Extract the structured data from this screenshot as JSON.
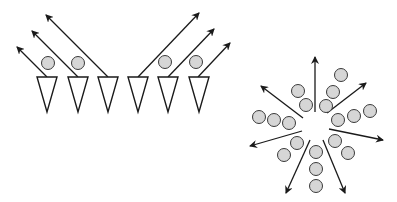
{
  "colors": {
    "background": "#ffffff",
    "stroke": "#1a1a1a",
    "particle_fill": "#d6d6d6",
    "particle_stroke": "#3a3a3a"
  },
  "left_panel": {
    "label": "aligned-collective-motion",
    "triangles": [
      {
        "x1": 37,
        "x2": 57,
        "top": 77,
        "apex_x": 47,
        "apex_y": 112
      },
      {
        "x1": 68,
        "x2": 88,
        "top": 77,
        "apex_x": 78,
        "apex_y": 112
      },
      {
        "x1": 98,
        "x2": 118,
        "top": 77,
        "apex_x": 108,
        "apex_y": 112
      },
      {
        "x1": 128,
        "x2": 148,
        "top": 77,
        "apex_x": 138,
        "apex_y": 112
      },
      {
        "x1": 158,
        "x2": 178,
        "top": 77,
        "apex_x": 168,
        "apex_y": 112
      },
      {
        "x1": 189,
        "x2": 209,
        "top": 77,
        "apex_x": 199,
        "apex_y": 112
      }
    ],
    "particles": [
      {
        "cx": 48,
        "cy": 63,
        "r": 6.5
      },
      {
        "cx": 78,
        "cy": 63,
        "r": 6.5
      },
      {
        "cx": 165,
        "cy": 62,
        "r": 6.5
      },
      {
        "cx": 196,
        "cy": 62,
        "r": 6.5
      }
    ],
    "arrows": [
      {
        "x1": 47,
        "y1": 77,
        "x2": 17,
        "y2": 47
      },
      {
        "x1": 78,
        "y1": 77,
        "x2": 32,
        "y2": 31
      },
      {
        "x1": 108,
        "y1": 77,
        "x2": 46,
        "y2": 15
      },
      {
        "x1": 138,
        "y1": 77,
        "x2": 199,
        "y2": 13
      },
      {
        "x1": 168,
        "y1": 77,
        "x2": 214,
        "y2": 29
      },
      {
        "x1": 198,
        "y1": 77,
        "x2": 230,
        "y2": 43
      }
    ]
  },
  "right_panel": {
    "label": "radial-dispersal",
    "arrows": [
      {
        "x1": 315,
        "y1": 112,
        "x2": 315,
        "y2": 57
      },
      {
        "x1": 327,
        "y1": 113,
        "x2": 366,
        "y2": 83
      },
      {
        "x1": 329,
        "y1": 129,
        "x2": 383,
        "y2": 140
      },
      {
        "x1": 323,
        "y1": 140,
        "x2": 345,
        "y2": 193
      },
      {
        "x1": 310,
        "y1": 140,
        "x2": 286,
        "y2": 193
      },
      {
        "x1": 302,
        "y1": 131,
        "x2": 250,
        "y2": 146
      },
      {
        "x1": 303,
        "y1": 118,
        "x2": 261,
        "y2": 86
      }
    ],
    "particles": [
      {
        "cx": 341,
        "cy": 75,
        "r": 6.5
      },
      {
        "cx": 333,
        "cy": 92,
        "r": 6.5
      },
      {
        "cx": 326,
        "cy": 106,
        "r": 6.5
      },
      {
        "cx": 298,
        "cy": 91,
        "r": 6.5
      },
      {
        "cx": 306,
        "cy": 105,
        "r": 6.5
      },
      {
        "cx": 259,
        "cy": 117,
        "r": 6.5
      },
      {
        "cx": 274,
        "cy": 120,
        "r": 6.5
      },
      {
        "cx": 289,
        "cy": 123,
        "r": 6.5
      },
      {
        "cx": 338,
        "cy": 120,
        "r": 6.5
      },
      {
        "cx": 354,
        "cy": 116,
        "r": 6.5
      },
      {
        "cx": 370,
        "cy": 111,
        "r": 6.5
      },
      {
        "cx": 297,
        "cy": 143,
        "r": 6.5
      },
      {
        "cx": 284,
        "cy": 155,
        "r": 6.5
      },
      {
        "cx": 316,
        "cy": 152,
        "r": 6.5
      },
      {
        "cx": 316,
        "cy": 169,
        "r": 6.5
      },
      {
        "cx": 316,
        "cy": 186,
        "r": 6.5
      },
      {
        "cx": 335,
        "cy": 141,
        "r": 6.5
      },
      {
        "cx": 348,
        "cy": 153,
        "r": 6.5
      }
    ]
  }
}
